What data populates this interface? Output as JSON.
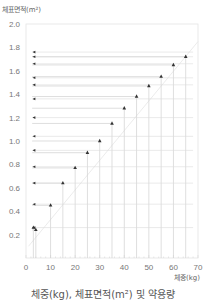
{
  "chart_data": {
    "type": "line",
    "title": "체중(kg), 체표면적(m²) 및 약용량",
    "xlabel": "체중(kg)",
    "ylabel": "체표면적(m²)",
    "xlim": [
      0,
      70
    ],
    "ylim": [
      0,
      2.0
    ],
    "x_ticks": [
      "0",
      "10",
      "20",
      "30",
      "40",
      "50",
      "60",
      "70"
    ],
    "y_ticks": [
      "0.2",
      "0.4",
      "0.6",
      "0.8",
      "1.0",
      "1.2",
      "1.4",
      "1.6",
      "1.8",
      "2.0"
    ],
    "grid": false,
    "legend": null,
    "series": [
      {
        "name": "체표면적",
        "x": [
          3,
          4,
          10,
          15,
          20,
          25,
          30,
          35,
          40,
          45,
          50,
          55,
          60,
          65
        ],
        "values": [
          0.26,
          0.24,
          0.45,
          0.64,
          0.77,
          0.9,
          1.0,
          1.15,
          1.28,
          1.38,
          1.47,
          1.55,
          1.65,
          1.72
        ]
      }
    ],
    "left_markers_y": [
      0.26,
      0.46,
      0.64,
      0.78,
      0.92,
      1.04,
      1.2,
      1.36,
      1.48,
      1.54,
      1.66,
      1.72,
      1.76
    ]
  },
  "labels": {
    "y_axis_title": "체표면적(m²)",
    "x_axis_title": "체중(kg)",
    "caption": "체중(kg), 체표면적(m²) 및 약용량"
  }
}
